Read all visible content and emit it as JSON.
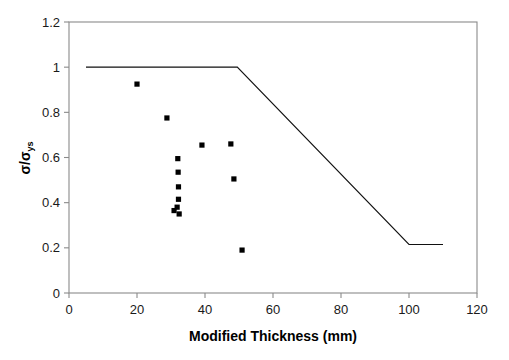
{
  "chart_data": {
    "type": "scatter",
    "title": "",
    "xlabel": "Modified Thickness (mm)",
    "ylabel": "σ/σys",
    "ylabel_main": "σ/σ",
    "ylabel_subscript": "ys",
    "xlim": [
      0,
      120
    ],
    "ylim": [
      0,
      1.2
    ],
    "xticks": [
      0,
      20,
      40,
      60,
      80,
      100,
      120
    ],
    "yticks": [
      0,
      0.2,
      0.4,
      0.6,
      0.8,
      1,
      1.2
    ],
    "xtick_labels": [
      "0",
      "20",
      "40",
      "60",
      "80",
      "100",
      "120"
    ],
    "ytick_labels": [
      "0",
      "0.2",
      "0.4",
      "0.6",
      "0.8",
      "1",
      "1.2"
    ],
    "grid": false,
    "legend": null,
    "marker": "filled-square",
    "marker_color": "#000000",
    "line_color": "#000000",
    "frame_color": "#808080",
    "series": [
      {
        "name": "data",
        "type": "scatter",
        "points": [
          [
            20.0,
            0.925
          ],
          [
            28.8,
            0.775
          ],
          [
            39.1,
            0.655
          ],
          [
            32.0,
            0.595
          ],
          [
            47.6,
            0.66
          ],
          [
            32.1,
            0.535
          ],
          [
            48.5,
            0.505
          ],
          [
            32.2,
            0.47
          ],
          [
            32.2,
            0.415
          ],
          [
            31.8,
            0.38
          ],
          [
            30.9,
            0.365
          ],
          [
            32.4,
            0.35
          ],
          [
            50.9,
            0.19
          ]
        ]
      },
      {
        "name": "assessment-curve",
        "type": "line",
        "points": [
          [
            5.0,
            1.0
          ],
          [
            49.5,
            1.0
          ],
          [
            100.0,
            0.215
          ],
          [
            110.0,
            0.215
          ]
        ]
      }
    ]
  },
  "axis": {
    "x_title": "Modified Thickness (mm)"
  }
}
